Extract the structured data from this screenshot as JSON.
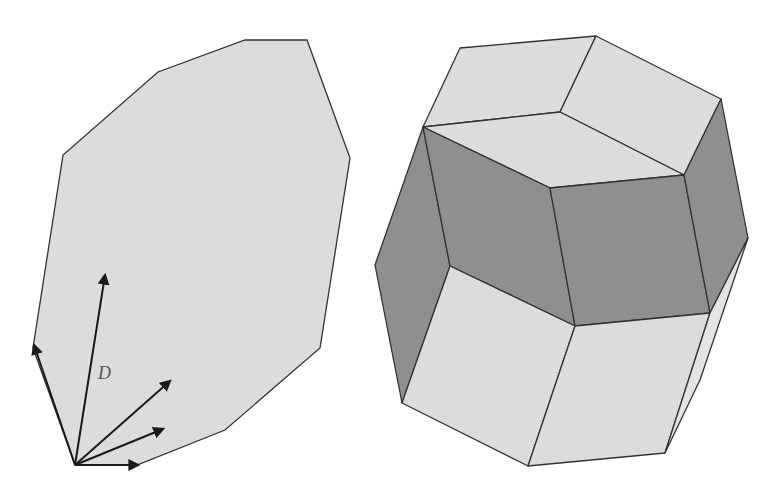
{
  "figure": {
    "left_panel": {
      "description": "Zonogon (centrally symmetric polygon) generated by vectors",
      "vector_label": "D",
      "polygon": [
        [
          245,
          40
        ],
        [
          307,
          40
        ],
        [
          350,
          158
        ],
        [
          320,
          348
        ],
        [
          225,
          430
        ],
        [
          137,
          465
        ],
        [
          75,
          465
        ],
        [
          33,
          348
        ],
        [
          63,
          155
        ],
        [
          158,
          72
        ]
      ],
      "origin": [
        75,
        465
      ],
      "vectors": [
        [
          33,
          345
        ],
        [
          105,
          275
        ],
        [
          170,
          381
        ],
        [
          165,
          403
        ],
        [
          138,
          465
        ]
      ]
    },
    "right_panel": {
      "description": "Zonohedron (rhombic polyhedron) with shaded zone",
      "colors": {
        "light_face": "#dcdcdc",
        "dark_face": "#8f8f8f",
        "edge": "#333333"
      }
    }
  }
}
